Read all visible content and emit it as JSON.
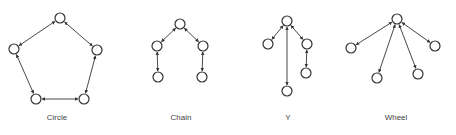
{
  "colors": {
    "stroke": "#333333",
    "background": "#ffffff"
  },
  "node_radius": 5,
  "networks": [
    {
      "name": "Circle",
      "label_x": 57,
      "nodes": [
        [
          60,
          18
        ],
        [
          97,
          50
        ],
        [
          84,
          99
        ],
        [
          36,
          99
        ],
        [
          14,
          49
        ]
      ],
      "edges": [
        [
          0,
          1
        ],
        [
          1,
          2
        ],
        [
          2,
          3
        ],
        [
          3,
          4
        ],
        [
          4,
          0
        ]
      ]
    },
    {
      "name": "Chain",
      "label_x": 181,
      "nodes": [
        [
          180,
          24
        ],
        [
          157,
          46
        ],
        [
          203,
          46
        ],
        [
          158,
          77
        ],
        [
          202,
          77
        ]
      ],
      "edges": [
        [
          0,
          1
        ],
        [
          0,
          2
        ],
        [
          1,
          3
        ],
        [
          2,
          4
        ]
      ]
    },
    {
      "name": "Y",
      "label_x": 288,
      "nodes": [
        [
          287,
          21
        ],
        [
          268,
          44
        ],
        [
          307,
          44
        ],
        [
          306,
          73
        ],
        [
          287,
          91
        ]
      ],
      "edges": [
        [
          0,
          1
        ],
        [
          0,
          2
        ],
        [
          2,
          3
        ],
        [
          0,
          4
        ]
      ]
    },
    {
      "name": "Wheel",
      "label_x": 396,
      "nodes": [
        [
          397,
          19
        ],
        [
          351,
          48
        ],
        [
          435,
          46
        ],
        [
          377,
          78
        ],
        [
          418,
          74
        ]
      ],
      "edges": [
        [
          0,
          1
        ],
        [
          0,
          2
        ],
        [
          0,
          3
        ],
        [
          0,
          4
        ]
      ]
    }
  ]
}
